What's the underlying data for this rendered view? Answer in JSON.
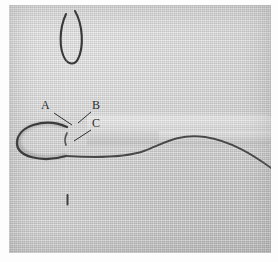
{
  "photo": {
    "subject": "embroidery-needle-and-thread-on-linen",
    "background_color": "#cdcdcd",
    "paper_color": "#ffffff",
    "thread_color": "#3a3a3a",
    "needle_color": "#4a4a4a"
  },
  "labels": [
    {
      "id": "A",
      "text": "A",
      "x": 36,
      "y": 101
    },
    {
      "id": "B",
      "text": "B",
      "x": 84,
      "y": 101
    },
    {
      "id": "C",
      "text": "C",
      "x": 84,
      "y": 119
    }
  ],
  "leaders": [
    {
      "id": "leader-a",
      "from": "A",
      "x1": 45,
      "y1": 108,
      "x2": 63,
      "y2": 120
    },
    {
      "id": "leader-b",
      "from": "B",
      "x1": 82,
      "y1": 107,
      "x2": 69,
      "y2": 118
    },
    {
      "id": "leader-c",
      "from": "C",
      "x1": 82,
      "y1": 125,
      "x2": 65,
      "y2": 136
    }
  ],
  "elements": {
    "needle": "vertical sewing needle piercing the fabric",
    "needle_eye_loop": "thread loop through the needle eye at top",
    "left_thread_loop": "thread loop lying on the fabric to the left",
    "thread_tail": "thread running right and down toward the lower right corner",
    "fabric_fold": "faint horizontal fold band extending right of the needle"
  }
}
